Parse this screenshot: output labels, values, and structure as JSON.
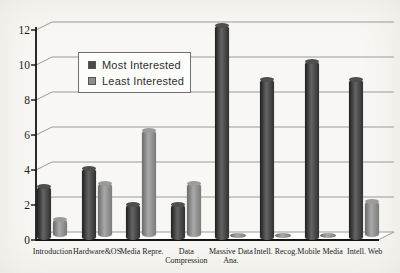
{
  "chart_data": {
    "type": "bar",
    "style": "3d-cylinder-columns",
    "title": "",
    "xlabel": "",
    "ylabel": "",
    "categories": [
      "Introduction",
      "Hardware&OS",
      "Media Repre.",
      "Data Compression",
      "Massive Data Ana.",
      "Intell. Recog.",
      "Mobile Media",
      "Intell. Web"
    ],
    "category_label_lines": [
      [
        "Introduction"
      ],
      [
        "Hardware&OS"
      ],
      [
        "Media Repre."
      ],
      [
        "Data",
        "Compression"
      ],
      [
        "Massive Data",
        "Ana."
      ],
      [
        "Intell. Recog."
      ],
      [
        "Mobile Media"
      ],
      [
        "Intell. Web"
      ]
    ],
    "series": [
      {
        "name": "Most Interested",
        "values": [
          3,
          4,
          2,
          2,
          12,
          9,
          10,
          9
        ],
        "color": "#4a4a4a"
      },
      {
        "name": "Least Interested",
        "values": [
          1,
          3,
          6,
          3,
          0,
          0,
          0,
          2
        ],
        "color": "#8e8e8e"
      }
    ],
    "ylim": [
      0,
      12
    ],
    "yticks": [
      0,
      2,
      4,
      6,
      8,
      10,
      12
    ],
    "grid": true,
    "legend_position": "upper-left-inside"
  },
  "legend": {
    "items": [
      {
        "label": "Most Interested",
        "color": "#4a4a4a"
      },
      {
        "label": "Least Interested",
        "color": "#8e8e8e"
      }
    ]
  },
  "colors": {
    "axis": "#141414",
    "gridline": "#9a9a9a",
    "floor_fill": "#fdfdfb",
    "floor_edge": "#9a9a9a",
    "background": "#f8f7f3"
  }
}
